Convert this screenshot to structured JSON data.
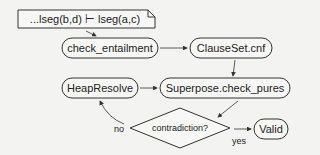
{
  "diagram": {
    "entailment_box": {
      "left": "...lseg(b,d)",
      "turnstile": "⊢",
      "right": "lseg(a,c)",
      "label": "...lseg(b,d) ⊢ lseg(a,c)"
    },
    "nodes": {
      "check_entailment": "check_entailment",
      "clauseset_cnf": "ClauseSet.cnf",
      "heap_resolve": "HeapResolve",
      "superpose": "Superpose.check_pures",
      "decision": "contradiction?",
      "valid": "Valid"
    },
    "edge_labels": {
      "no": "no",
      "yes": "yes"
    },
    "colors": {
      "stroke": "#333333",
      "background": "#f3f3f1",
      "text": "#222222"
    }
  }
}
